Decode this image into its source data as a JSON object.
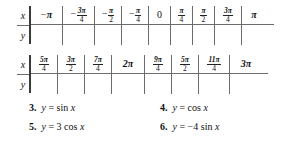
{
  "tables": [
    {
      "id": "table-1",
      "row_labels": {
        "x": "x",
        "y": "y"
      },
      "x_values": [
        {
          "sign": "−",
          "kind": "whole",
          "text": "π"
        },
        {
          "sign": "−",
          "kind": "frac",
          "num": "3π",
          "den": "4"
        },
        {
          "sign": "−",
          "kind": "frac",
          "num": "π",
          "den": "2"
        },
        {
          "sign": "−",
          "kind": "frac",
          "num": "π",
          "den": "4"
        },
        {
          "sign": "",
          "kind": "whole",
          "text": "0"
        },
        {
          "sign": "",
          "kind": "frac",
          "num": "π",
          "den": "4"
        },
        {
          "sign": "",
          "kind": "frac",
          "num": "π",
          "den": "2"
        },
        {
          "sign": "",
          "kind": "frac",
          "num": "3π",
          "den": "4"
        },
        {
          "sign": "",
          "kind": "whole",
          "text": "π"
        }
      ],
      "y_values": [
        "",
        "",
        "",
        "",
        "",
        "",
        "",
        "",
        ""
      ]
    },
    {
      "id": "table-2",
      "row_labels": {
        "x": "x",
        "y": "y"
      },
      "x_values": [
        {
          "sign": "",
          "kind": "frac",
          "num": "5π",
          "den": "4"
        },
        {
          "sign": "",
          "kind": "frac",
          "num": "3π",
          "den": "2"
        },
        {
          "sign": "",
          "kind": "frac",
          "num": "7π",
          "den": "4"
        },
        {
          "sign": "",
          "kind": "whole",
          "text": "2π"
        },
        {
          "sign": "",
          "kind": "frac",
          "num": "9π",
          "den": "4"
        },
        {
          "sign": "",
          "kind": "frac",
          "num": "5π",
          "den": "2"
        },
        {
          "sign": "",
          "kind": "frac",
          "num": "11π",
          "den": "4"
        },
        {
          "sign": "",
          "kind": "whole",
          "text": "3π"
        }
      ],
      "y_values": [
        "",
        "",
        "",
        "",
        "",
        "",
        "",
        ""
      ]
    }
  ],
  "exercises": [
    {
      "number": "3.",
      "lhs": "y",
      "eq": "=",
      "rhs_coef": "",
      "rhs_fn": "sin",
      "rhs_var": "x"
    },
    {
      "number": "4.",
      "lhs": "y",
      "eq": "=",
      "rhs_coef": "",
      "rhs_fn": "cos",
      "rhs_var": "x"
    },
    {
      "number": "5.",
      "lhs": "y",
      "eq": "=",
      "rhs_coef": "3",
      "rhs_fn": "cos",
      "rhs_var": "x"
    },
    {
      "number": "6.",
      "lhs": "y",
      "eq": "=",
      "rhs_coef": "−4",
      "rhs_fn": "sin",
      "rhs_var": "x"
    }
  ],
  "colors": {
    "ink": "#111111",
    "rule": "#6b6b6b",
    "thick_rule": "#3a3a3a",
    "background": "#ffffff"
  }
}
